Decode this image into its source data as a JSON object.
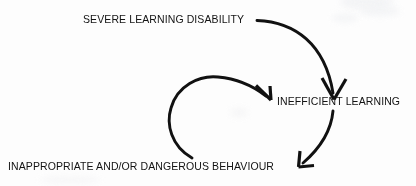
{
  "diagram": {
    "type": "cycle-flow",
    "stroke_color": "#111111",
    "background_color": "#fdfdfd",
    "nodes": [
      {
        "id": "severe",
        "label": "SEVERE LEARNING DISABILITY"
      },
      {
        "id": "inefficient",
        "label": "INEFFICIENT LEARNING"
      },
      {
        "id": "behaviour",
        "label": "INAPPROPRIATE AND/OR DANGEROUS BEHAVIOUR"
      }
    ],
    "edges": [
      {
        "id": "severe-to-inefficient",
        "from": "severe",
        "to": "inefficient",
        "style": "curved-arrow",
        "direction": "down"
      },
      {
        "id": "inefficient-to-behaviour",
        "from": "inefficient",
        "to": "behaviour",
        "style": "curved-arrow",
        "direction": "down-left"
      },
      {
        "id": "behaviour-to-inefficient",
        "from": "behaviour",
        "to": "inefficient",
        "style": "curved-arrow",
        "direction": "down-right"
      }
    ]
  }
}
